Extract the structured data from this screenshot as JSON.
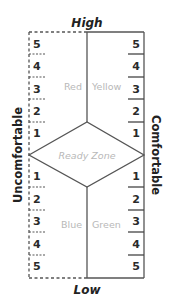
{
  "diagram": {
    "top_label": "High",
    "bottom_label": "Low",
    "left_label": "Uncomfortable",
    "right_label": "Comfortable",
    "center_label": "Ready Zone",
    "quadrants": {
      "top_left": "Red",
      "top_right": "Yellow",
      "bottom_left": "Blue",
      "bottom_right": "Green"
    },
    "left_scale_top": [
      "5",
      "4",
      "3",
      "2",
      "1"
    ],
    "left_scale_bottom": [
      "1",
      "2",
      "3",
      "4",
      "5"
    ],
    "right_scale_top": [
      "5",
      "4",
      "3",
      "2",
      "1"
    ],
    "right_scale_bottom": [
      "1",
      "2",
      "3",
      "4",
      "5"
    ]
  }
}
